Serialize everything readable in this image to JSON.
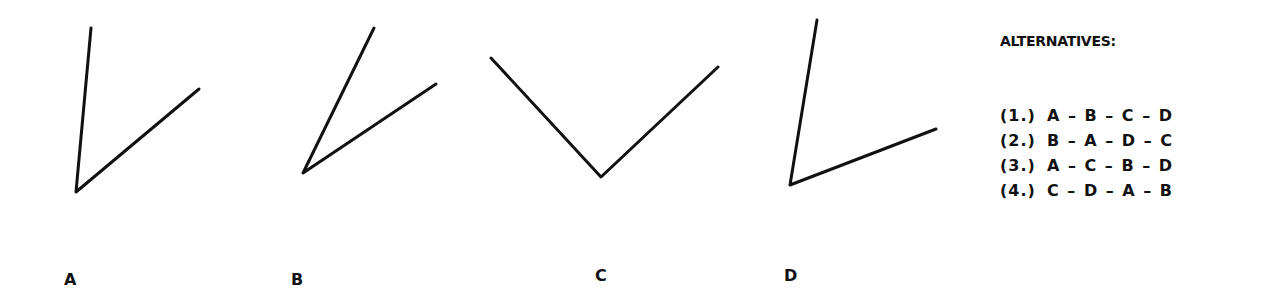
{
  "figures": [
    {
      "label": "A",
      "label_pos": [
        64,
        270
      ],
      "vertex": [
        76,
        192
      ],
      "arm1": [
        91,
        28
      ],
      "arm2": [
        199,
        89
      ]
    },
    {
      "label": "B",
      "label_pos": [
        291,
        270
      ],
      "vertex": [
        303,
        173
      ],
      "arm1": [
        374,
        28
      ],
      "arm2": [
        436,
        84
      ]
    },
    {
      "label": "C",
      "label_pos": [
        595,
        266
      ],
      "vertex": [
        601,
        177
      ],
      "arm1": [
        491,
        58
      ],
      "arm2": [
        718,
        67
      ]
    },
    {
      "label": "D",
      "label_pos": [
        784,
        266
      ],
      "vertex": [
        790,
        185
      ],
      "arm1": [
        817,
        20
      ],
      "arm2": [
        936,
        129
      ]
    }
  ],
  "alternatives": {
    "title": "ALTERNATIVES:",
    "items": [
      {
        "num": "(1.)",
        "sequence": "A – B – C – D"
      },
      {
        "num": "(2.)",
        "sequence": "B – A – D – C"
      },
      {
        "num": "(3.)",
        "sequence": "A – C – B – D"
      },
      {
        "num": "(4.)",
        "sequence": "C – D – A – B"
      }
    ]
  },
  "style": {
    "stroke_color": "#111111",
    "stroke_width": 3
  }
}
